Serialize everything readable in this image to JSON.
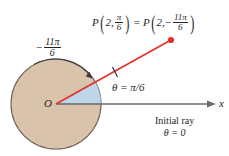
{
  "figure": {
    "colors": {
      "background": "#ffffff",
      "circle_fill": "#d9c3ab",
      "circle_stroke": "#6e6058",
      "sector_fill": "#bfd5e8",
      "sector_stroke": "#8fa9bf",
      "ray_red": "#e8302a",
      "axis_gray": "#6d6d6d",
      "text": "#262626"
    },
    "point_label": {
      "p_left": "P",
      "r_left": "2,",
      "theta_left_num": "π",
      "theta_left_den": "6",
      "equals": "=",
      "p_right": "P",
      "r_right": "2,",
      "sign_right": "−",
      "theta_right_num": "11π",
      "theta_right_den": "6",
      "open_paren": "(",
      "close_paren": ")"
    },
    "negative_angle_label": {
      "sign": "−",
      "numerator": "11π",
      "denominator": "6"
    },
    "theta_label": "θ = π/6",
    "origin_label": "O",
    "axis_label": "x",
    "initial_ray_caption": {
      "line1": "Initial ray",
      "line2": "θ = 0"
    },
    "geometry": {
      "origin": {
        "x": 56,
        "y": 104
      },
      "circle_radius": 45,
      "point_p": {
        "x": 171,
        "y": 40
      },
      "angle_degrees": 30,
      "axis_end_x": 214,
      "sector_radius": 45
    }
  }
}
